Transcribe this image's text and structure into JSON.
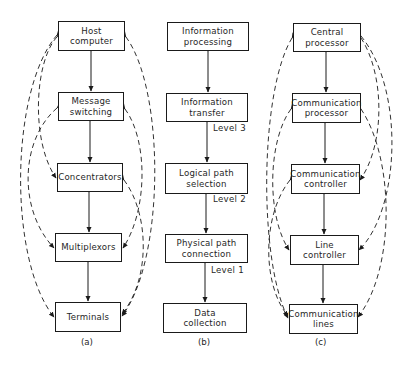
{
  "colors": {
    "ink": "#1a1a1a",
    "background": "#ffffff"
  },
  "diagrams": {
    "a": {
      "caption": "(a)",
      "boxes": [
        {
          "line1": "Host",
          "line2": "computer"
        },
        {
          "line1": "Message",
          "line2": "switching"
        },
        {
          "line1": "Concentrators",
          "line2": ""
        },
        {
          "line1": "Multiplexors",
          "line2": ""
        },
        {
          "line1": "Terminals",
          "line2": ""
        }
      ],
      "dashed_links": [
        [
          "Host computer",
          "Concentrators"
        ],
        [
          "Host computer",
          "Terminals"
        ],
        [
          "Message switching",
          "Multiplexors"
        ],
        [
          "Host computer",
          "Terminals"
        ],
        [
          "Message switching",
          "Multiplexors"
        ],
        [
          "Concentrators",
          "Terminals"
        ]
      ]
    },
    "b": {
      "caption": "(b)",
      "boxes": [
        {
          "line1": "Information",
          "line2": "processing"
        },
        {
          "line1": "Information",
          "line2": "transfer"
        },
        {
          "line1": "Logical path",
          "line2": "selection"
        },
        {
          "line1": "Physical path",
          "line2": "connection"
        },
        {
          "line1": "Data",
          "line2": "collection"
        }
      ],
      "levels": [
        "Level 3",
        "Level 2",
        "Level 1"
      ]
    },
    "c": {
      "caption": "(c)",
      "boxes": [
        {
          "line1": "Central",
          "line2": "processor"
        },
        {
          "line1": "Communication",
          "line2": "processor"
        },
        {
          "line1": "Communication",
          "line2": "controller"
        },
        {
          "line1": "Line",
          "line2": "controller"
        },
        {
          "line1": "Communication",
          "line2": "lines"
        }
      ],
      "dashed_links": [
        [
          "Central processor",
          "Communication lines"
        ],
        [
          "Communication processor",
          "Line controller"
        ],
        [
          "Communication controller",
          "Communication lines"
        ],
        [
          "Central processor",
          "Communication controller"
        ],
        [
          "Central processor",
          "Line controller"
        ],
        [
          "Communication processor",
          "Communication lines"
        ]
      ]
    }
  }
}
